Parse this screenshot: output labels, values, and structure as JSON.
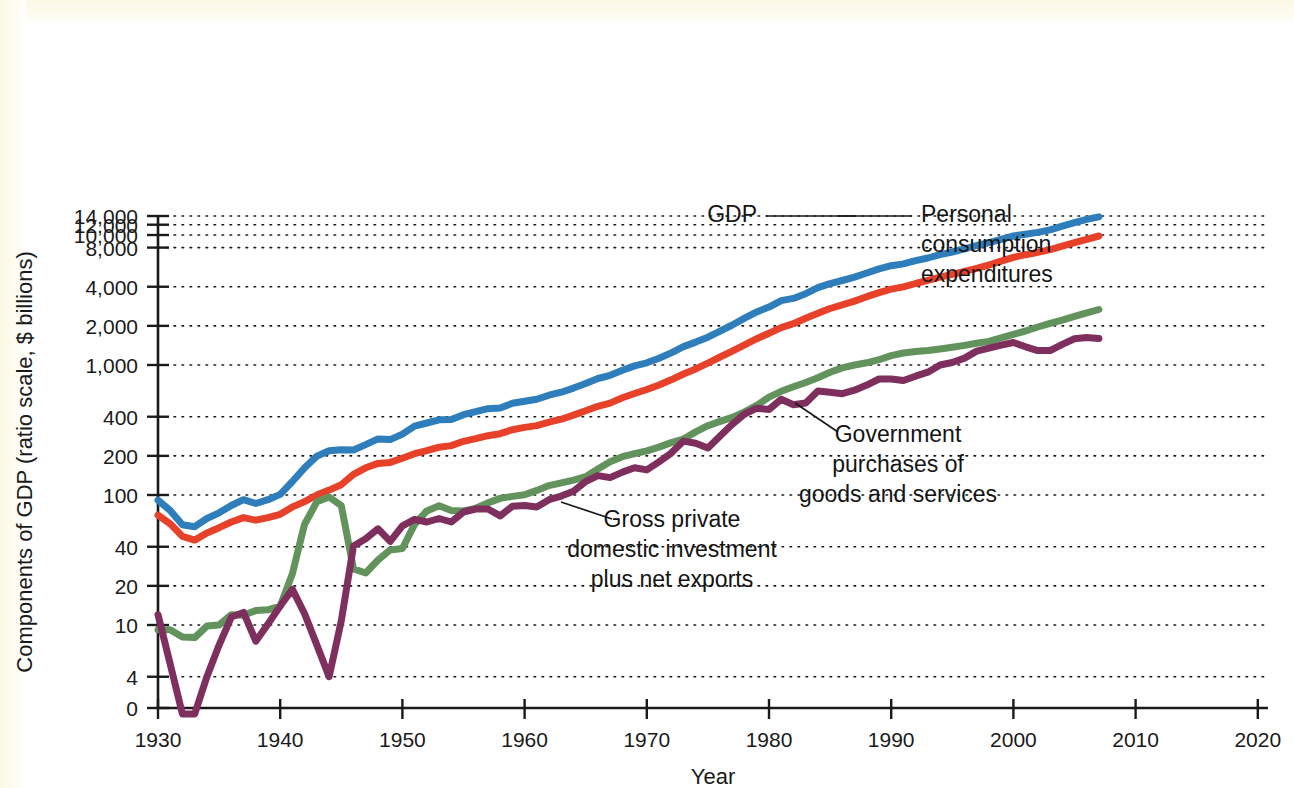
{
  "figure": {
    "background_color": "#ffffff",
    "axis_color": "#1a1a1a"
  },
  "axes": {
    "y_title": "Components of GDP (ratio scale, $ billions)",
    "x_title": "Year",
    "y_ticks": [
      "14,000",
      "12,000",
      "10,000",
      "8,000",
      "4,000",
      "2,000",
      "1,000",
      "400",
      "200",
      "100",
      "40",
      "20",
      "10",
      "4",
      "0"
    ],
    "x_ticks": [
      "1930",
      "1940",
      "1950",
      "1960",
      "1970",
      "1980",
      "1990",
      "2000",
      "2010",
      "2020"
    ]
  },
  "annotations": [
    {
      "name": "gdp",
      "lines": [
        "GDP"
      ],
      "anchor": "end",
      "x": 757,
      "y": 222,
      "leader": [
        [
          766,
          216
        ],
        [
          856,
          216
        ]
      ]
    },
    {
      "name": "personal-consumption",
      "lines": [
        "Personal",
        "consumption",
        "expenditures"
      ],
      "anchor": "start",
      "x": 921,
      "y": 222,
      "leader": [
        [
          912,
          216
        ],
        [
          838,
          216
        ]
      ]
    },
    {
      "name": "government-purchases",
      "lines": [
        "Government",
        "purchases of",
        "goods and services"
      ],
      "anchor": "middle",
      "x": 898,
      "y": 442,
      "leader": [
        [
          838,
          432
        ],
        [
          795,
          403
        ]
      ]
    },
    {
      "name": "gross-private-investment",
      "lines": [
        "Gross private",
        "domestic investment",
        "plus net exports"
      ],
      "anchor": "middle",
      "x": 672,
      "y": 527,
      "leader": [
        [
          612,
          519
        ],
        [
          561,
          502
        ]
      ]
    }
  ],
  "chart_data": {
    "type": "line",
    "title": "",
    "xlabel": "Year",
    "ylabel": "Components of GDP (ratio scale, $ billions)",
    "y_scale": "log (ratio scale)",
    "xlim": [
      1930,
      2020
    ],
    "ylim": [
      3.2,
      15000
    ],
    "y_tick_values": [
      14000,
      12000,
      10000,
      8000,
      4000,
      2000,
      1000,
      400,
      200,
      100,
      40,
      20,
      10,
      4,
      0
    ],
    "x_tick_values": [
      1930,
      1940,
      1950,
      1960,
      1970,
      1980,
      1990,
      2000,
      2010,
      2020
    ],
    "grid": true,
    "legend": "inline annotations",
    "x": [
      1930,
      1931,
      1932,
      1933,
      1934,
      1935,
      1936,
      1937,
      1938,
      1939,
      1940,
      1941,
      1942,
      1943,
      1944,
      1945,
      1946,
      1947,
      1948,
      1949,
      1950,
      1951,
      1952,
      1953,
      1954,
      1955,
      1956,
      1957,
      1958,
      1959,
      1960,
      1961,
      1962,
      1963,
      1964,
      1965,
      1966,
      1967,
      1968,
      1969,
      1970,
      1971,
      1972,
      1973,
      1974,
      1975,
      1976,
      1977,
      1978,
      1979,
      1980,
      1981,
      1982,
      1983,
      1984,
      1985,
      1986,
      1987,
      1988,
      1989,
      1990,
      1991,
      1992,
      1993,
      1994,
      1995,
      1996,
      1997,
      1998,
      1999,
      2000,
      2001,
      2002,
      2003,
      2004,
      2005,
      2006,
      2007
    ],
    "series": [
      {
        "name": "GDP",
        "color": "#2e7ebb",
        "values": [
          91,
          76,
          59,
          57,
          66,
          73,
          83,
          92,
          86,
          92,
          101,
          127,
          162,
          199,
          219,
          223,
          222,
          244,
          270,
          267,
          294,
          339,
          358,
          379,
          380,
          415,
          438,
          461,
          467,
          507,
          527,
          545,
          586,
          618,
          664,
          720,
          788,
          833,
          910,
          985,
          1039,
          1128,
          1240,
          1386,
          1501,
          1635,
          1824,
          2031,
          2295,
          2563,
          2790,
          3128,
          3255,
          3537,
          3933,
          4220,
          4463,
          4740,
          5104,
          5484,
          5803,
          5996,
          6338,
          6657,
          7072,
          7398,
          7817,
          8304,
          8747,
          9268,
          9817,
          10128,
          10470,
          10961,
          11713,
          12456,
          13178,
          13808
        ]
      },
      {
        "name": "Personal consumption expenditures",
        "color": "#e8412a",
        "values": [
          70,
          60,
          48,
          45,
          51,
          56,
          62,
          67,
          64,
          67,
          71,
          81,
          89,
          100,
          109,
          120,
          144,
          162,
          175,
          178,
          192,
          208,
          219,
          233,
          240,
          259,
          271,
          286,
          296,
          318,
          331,
          342,
          363,
          383,
          412,
          444,
          481,
          509,
          559,
          604,
          648,
          702,
          770,
          852,
          933,
          1034,
          1152,
          1278,
          1428,
          1592,
          1757,
          1941,
          2077,
          2290,
          2503,
          2720,
          2899,
          3100,
          3353,
          3598,
          3839,
          3986,
          4235,
          4477,
          4743,
          4976,
          5257,
          5547,
          5879,
          6282,
          6739,
          7055,
          7351,
          7709,
          8211,
          8742,
          9269,
          9826
        ]
      },
      {
        "name": "Government purchases of goods and services",
        "color": "#63935c",
        "values": [
          9.2,
          9.2,
          8.1,
          8.0,
          9.8,
          10.0,
          12.0,
          11.9,
          12.9,
          13.1,
          14.0,
          24.8,
          59.6,
          88.6,
          96.5,
          82.9,
          27.0,
          25.1,
          31.6,
          37.8,
          38.8,
          59.4,
          75.4,
          82.6,
          76.0,
          75.3,
          79.0,
          86.9,
          94.2,
          97.6,
          100.6,
          108.4,
          118.2,
          123.8,
          130.0,
          138.4,
          158.6,
          180.2,
          197.0,
          207.9,
          218.9,
          233.7,
          253.1,
          269.5,
          305.6,
          341.1,
          368.0,
          395.1,
          436.0,
          490.0,
          566.2,
          627.5,
          680.5,
          733.5,
          797.0,
          879.0,
          949.3,
          999.5,
          1039,
          1099,
          1181,
          1236,
          1271,
          1292,
          1328,
          1369,
          1416,
          1468,
          1518,
          1620,
          1722,
          1825,
          1961,
          2092,
          2216,
          2363,
          2518,
          2674
        ]
      },
      {
        "name": "Gross private domestic investment plus net exports",
        "color": "#7e2f5e",
        "values": [
          12.0,
          5.0,
          0.8,
          0.9,
          4.0,
          7.0,
          11.5,
          12.5,
          7.5,
          10.2,
          14.0,
          18.8,
          12.2,
          7.0,
          4.0,
          10.8,
          40.5,
          46.0,
          55.0,
          44.0,
          58.0,
          65.0,
          62.0,
          66.0,
          62.0,
          74.0,
          78.0,
          78.0,
          69.0,
          82.0,
          83.0,
          81.0,
          92.0,
          98.0,
          107.0,
          127.0,
          141.0,
          136.0,
          150.0,
          162.0,
          156.0,
          180.0,
          210.0,
          260.0,
          250.0,
          230.0,
          285.0,
          350.0,
          420.0,
          465.0,
          455.0,
          545.0,
          495.0,
          510.0,
          630.0,
          618.0,
          601.0,
          640.0,
          700.0,
          780.0,
          780.0,
          760.0,
          820.0,
          880.0,
          1000.0,
          1046.0,
          1130.0,
          1280.0,
          1350.0,
          1420.0,
          1490.0,
          1380.0,
          1290.0,
          1290.0,
          1440.0,
          1590.0,
          1630.0,
          1600.0
        ]
      }
    ]
  }
}
